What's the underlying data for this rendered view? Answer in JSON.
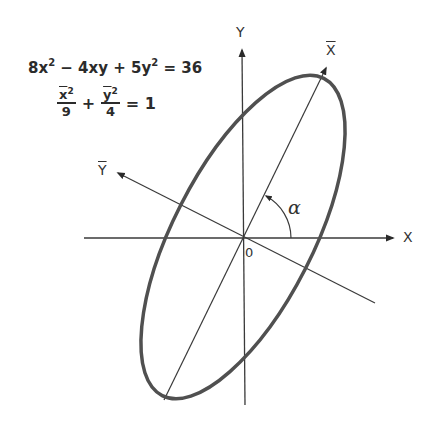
{
  "equations": {
    "general": {
      "coef_x2": "8x",
      "exp1": "2",
      "minus_term": "− 4xy +",
      "coef_y2": "5y",
      "exp2": "2",
      "rhs": "= 36"
    },
    "standard": {
      "term1_num": "x",
      "term1_exp": "2",
      "term1_den": "9",
      "plus": "+",
      "term2_num": "y",
      "term2_exp": "2",
      "term2_den": "4",
      "rhs": "= 1"
    }
  },
  "axes": {
    "x_label": "X",
    "y_label": "Y",
    "xbar_label": "X",
    "ybar_label": "Y",
    "origin_label": "0",
    "angle_label": "α"
  },
  "colors": {
    "ellipse": "#505050",
    "axes": "#3a3a3a",
    "text": "#2b2b2b"
  },
  "geometry": {
    "origin": [
      243,
      237
    ],
    "rotation_deg": 63,
    "semi_major_px": 180,
    "semi_minor_px": 70
  }
}
